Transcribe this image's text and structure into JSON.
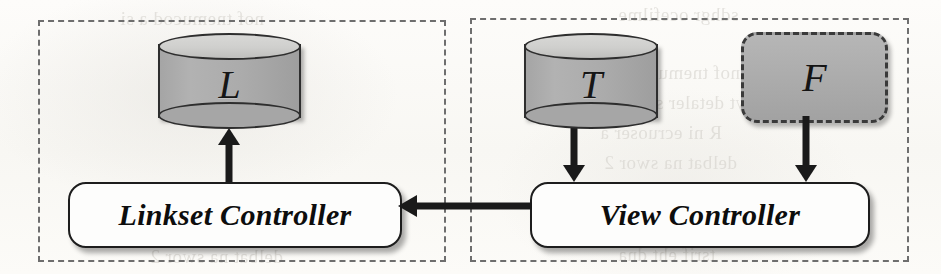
{
  "diagram": {
    "type": "architecture-diagram",
    "background_color": "#fbfaf8",
    "node_fill_gray": "#a8a8a8",
    "stroke_color": "#1d1d1d",
    "panels": [
      {
        "id": "linkset-panel",
        "style": "dashed",
        "label": ""
      },
      {
        "id": "view-panel",
        "style": "dashed",
        "label": ""
      }
    ],
    "nodes": [
      {
        "id": "L",
        "label": "L",
        "shape": "cylinder",
        "fill": "#a8a8a8",
        "panel": "linkset-panel"
      },
      {
        "id": "linkset-controller",
        "label": "Linkset Controller",
        "shape": "rounded-rect",
        "fill": "#fdfdfc",
        "panel": "linkset-panel"
      },
      {
        "id": "T",
        "label": "T",
        "shape": "cylinder",
        "fill": "#a8a8a8",
        "panel": "view-panel"
      },
      {
        "id": "F",
        "label": "F",
        "shape": "rounded-rect-dashed",
        "fill": "#a8a8a8",
        "panel": "view-panel"
      },
      {
        "id": "view-controller",
        "label": "View Controller",
        "shape": "rounded-rect",
        "fill": "#fdfdfc",
        "panel": "view-panel"
      }
    ],
    "edges": [
      {
        "id": "edge-linkset-to-L",
        "from": "linkset-controller",
        "to": "L",
        "direction": "up"
      },
      {
        "id": "edge-T-to-view",
        "from": "T",
        "to": "view-controller",
        "direction": "down"
      },
      {
        "id": "edge-F-to-view",
        "from": "F",
        "to": "view-controller",
        "direction": "down"
      },
      {
        "id": "edge-view-to-linkset",
        "from": "view-controller",
        "to": "linkset-controller",
        "direction": "left"
      }
    ]
  },
  "ghost_text": [
    {
      "id": "g1",
      "text": "sdhgr ocefilme",
      "x": 618,
      "y": 4
    },
    {
      "id": "g2",
      "text": "nof tnemucod a si",
      "x": 596,
      "y": 62
    },
    {
      "id": "g3",
      "text": "sebyt detaler ssecca",
      "x": 612,
      "y": 92
    },
    {
      "id": "g4",
      "text": "R ni ecruoser a",
      "x": 600,
      "y": 122
    },
    {
      "id": "g5",
      "text": "delbat na swor 2",
      "x": 604,
      "y": 152
    },
    {
      "id": "g6",
      "text": "skrowten rehtie",
      "x": 612,
      "y": 182
    },
    {
      "id": "g7",
      "text": "htiw sedon gniwollof",
      "x": 590,
      "y": 212
    },
    {
      "id": "g8",
      "text": "tsrif eht dna",
      "x": 618,
      "y": 244
    }
  ]
}
